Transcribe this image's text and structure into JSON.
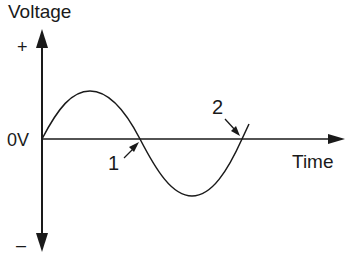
{
  "diagram": {
    "y_axis": {
      "label": "Voltage",
      "positive": "+",
      "negative": "–",
      "zero": "0V"
    },
    "x_axis": {
      "label": "Time"
    },
    "markers": [
      {
        "id": "1",
        "label": "1",
        "description": "zero crossing going negative"
      },
      {
        "id": "2",
        "label": "2",
        "description": "zero crossing going positive"
      }
    ],
    "colors": {
      "stroke": "#1a1a1a",
      "background": "#ffffff"
    }
  }
}
